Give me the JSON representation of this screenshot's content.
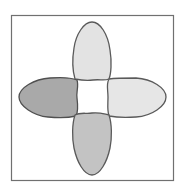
{
  "diagram": {
    "type": "four-petal-shape-arrangement",
    "frame": {
      "stroke": "#707070",
      "fill": "#ffffff"
    },
    "petals": [
      {
        "position": "top",
        "fill": "#e3e3e3",
        "stroke": "#5a5a5a"
      },
      {
        "position": "left",
        "fill": "#a9a9a9",
        "stroke": "#505050"
      },
      {
        "position": "right",
        "fill": "#e6e6e6",
        "stroke": "#5a5a5a"
      },
      {
        "position": "bottom",
        "fill": "#c3c3c3",
        "stroke": "#5a5a5a"
      }
    ]
  }
}
